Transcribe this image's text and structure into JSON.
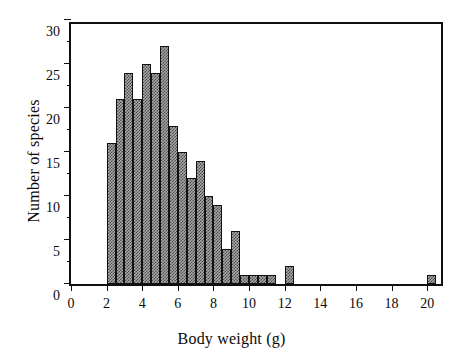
{
  "chart_data": {
    "type": "bar",
    "title": "",
    "xlabel": "Body weight (g)",
    "ylabel": "Number of species",
    "xlim": [
      0,
      21
    ],
    "ylim": [
      0,
      30
    ],
    "bin_width": 0.5,
    "xticks": [
      0,
      2,
      4,
      6,
      8,
      10,
      12,
      14,
      16,
      18,
      20
    ],
    "yticks": [
      0,
      5,
      10,
      15,
      20,
      25,
      30
    ],
    "y_minor_ticks": [
      2.5,
      7.5,
      12.5,
      17.5,
      22.5,
      27.5
    ],
    "grid": false,
    "legend": null,
    "bin_starts": [
      2.0,
      2.5,
      3.0,
      3.5,
      4.0,
      4.5,
      5.0,
      5.5,
      6.0,
      6.5,
      7.0,
      7.5,
      8.0,
      8.5,
      9.0,
      9.5,
      10.0,
      10.5,
      11.0,
      12.0,
      20.0
    ],
    "categories": [
      "2.0",
      "2.5",
      "3.0",
      "3.5",
      "4.0",
      "4.5",
      "5.0",
      "5.5",
      "6.0",
      "6.5",
      "7.0",
      "7.5",
      "8.0",
      "8.5",
      "9.0",
      "9.5",
      "10.0",
      "10.5",
      "11.0",
      "12.0",
      "20.0"
    ],
    "values": [
      16,
      21,
      24,
      21,
      25,
      24,
      27,
      18,
      15,
      12,
      14,
      10,
      9,
      4,
      6,
      1,
      1,
      1,
      1,
      2,
      1
    ],
    "bar_fill": "#a8a8a8",
    "bar_pattern": "checkerboard",
    "bar_edge_color": "#111111",
    "axis_color": "#101010",
    "background": "#ffffff"
  }
}
